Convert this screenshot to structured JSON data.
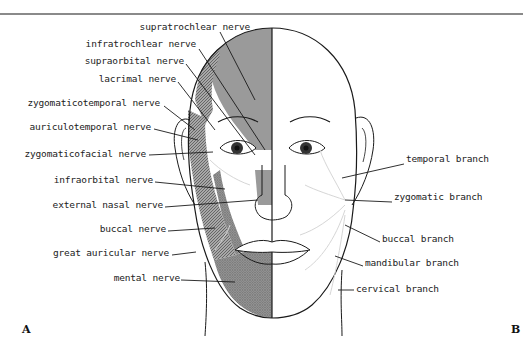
{
  "figure": {
    "panel_labels": {
      "left": "A",
      "right": "B"
    },
    "left_labels": [
      {
        "text": "supratrochlear nerve",
        "x": 250,
        "y": 27
      },
      {
        "text": "infratrochlear nerve",
        "x": 196,
        "y": 44
      },
      {
        "text": "supraorbital nerve",
        "x": 184,
        "y": 60
      },
      {
        "text": "lacrimal nerve",
        "x": 176,
        "y": 78
      },
      {
        "text": "zygomaticotemporal nerve",
        "x": 160,
        "y": 102
      },
      {
        "text": "auriculotemporal nerve",
        "x": 150,
        "y": 126
      },
      {
        "text": "zygomaticofacial nerve",
        "x": 145,
        "y": 153
      },
      {
        "text": "infraorbital nerve",
        "x": 152,
        "y": 179
      },
      {
        "text": "external nasal nerve",
        "x": 162,
        "y": 204
      },
      {
        "text": "buccal nerve",
        "x": 165,
        "y": 228
      },
      {
        "text": "great auricular nerve",
        "x": 168,
        "y": 252
      },
      {
        "text": "mental nerve",
        "x": 178,
        "y": 277
      }
    ],
    "right_labels": [
      {
        "text": "temporal branch",
        "x": 405,
        "y": 160
      },
      {
        "text": "zygomatic branch",
        "x": 393,
        "y": 198
      },
      {
        "text": "buccal branch",
        "x": 381,
        "y": 238
      },
      {
        "text": "mandibular branch",
        "x": 364,
        "y": 262
      },
      {
        "text": "cervical branch",
        "x": 355,
        "y": 288
      }
    ],
    "colors": {
      "forehead_shade": "#9a9a9a",
      "hatch_shade": "#7a7a7a",
      "line": "#1a1a1a",
      "nerve_branch": "#d6d6d6"
    }
  }
}
